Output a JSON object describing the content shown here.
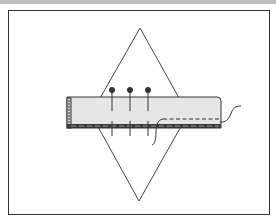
{
  "figure": {
    "type": "sewing-illustration",
    "colors": {
      "background": "#ffffff",
      "top_bar": "#bdbdbd",
      "frame_stroke": "#333333",
      "diamond_stroke": "#444444",
      "fabric_fill": "#e6e6e6",
      "fabric_stroke": "#333333",
      "hem_band": "#3a3a3a",
      "pin_color": "#333333",
      "thread_color": "#333333"
    },
    "frame": {
      "x": 8,
      "y": 10,
      "width": 261,
      "height": 204
    },
    "diamond": {
      "top": [
        140,
        28
      ],
      "right": [
        188,
        114
      ],
      "bottom": [
        139,
        201
      ],
      "left": [
        91,
        114
      ]
    },
    "fabric_strip": {
      "x": 67,
      "y": 97,
      "width": 154,
      "height": 31
    },
    "pins": [
      {
        "x": 112,
        "head_y": 90
      },
      {
        "x": 130,
        "head_y": 90
      },
      {
        "x": 148,
        "head_y": 90
      }
    ],
    "stitch_line": {
      "x1": 163,
      "x2": 220,
      "y": 119,
      "style": "dashed"
    }
  }
}
